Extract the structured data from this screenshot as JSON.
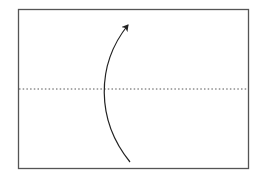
{
  "diagram": {
    "type": "fold-diagram",
    "paper": {
      "x": 18,
      "y": 9,
      "width": 230,
      "height": 159,
      "stroke": "#555555"
    },
    "fold_line": {
      "style": "valley-dotted",
      "y": 89,
      "stroke": "#555555"
    },
    "arrow": {
      "direction": "bottom-to-top",
      "stroke": "#222222"
    }
  }
}
